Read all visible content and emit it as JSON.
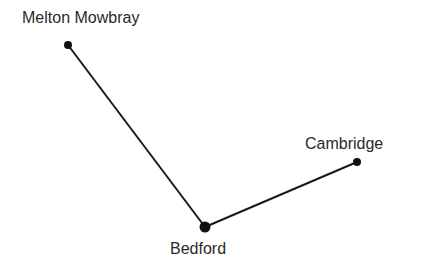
{
  "diagram": {
    "type": "route-map",
    "nodes": [
      {
        "id": "melton",
        "label": "Melton Mowbray",
        "x": 68,
        "y": 45,
        "r": 4
      },
      {
        "id": "bedford",
        "label": "Bedford",
        "x": 205,
        "y": 227,
        "r": 5.5
      },
      {
        "id": "cambridge",
        "label": "Cambridge",
        "x": 357,
        "y": 162,
        "r": 4
      }
    ],
    "edges": [
      {
        "from": "melton",
        "to": "bedford"
      },
      {
        "from": "bedford",
        "to": "cambridge"
      }
    ],
    "line_color": "#1a1a1a"
  }
}
